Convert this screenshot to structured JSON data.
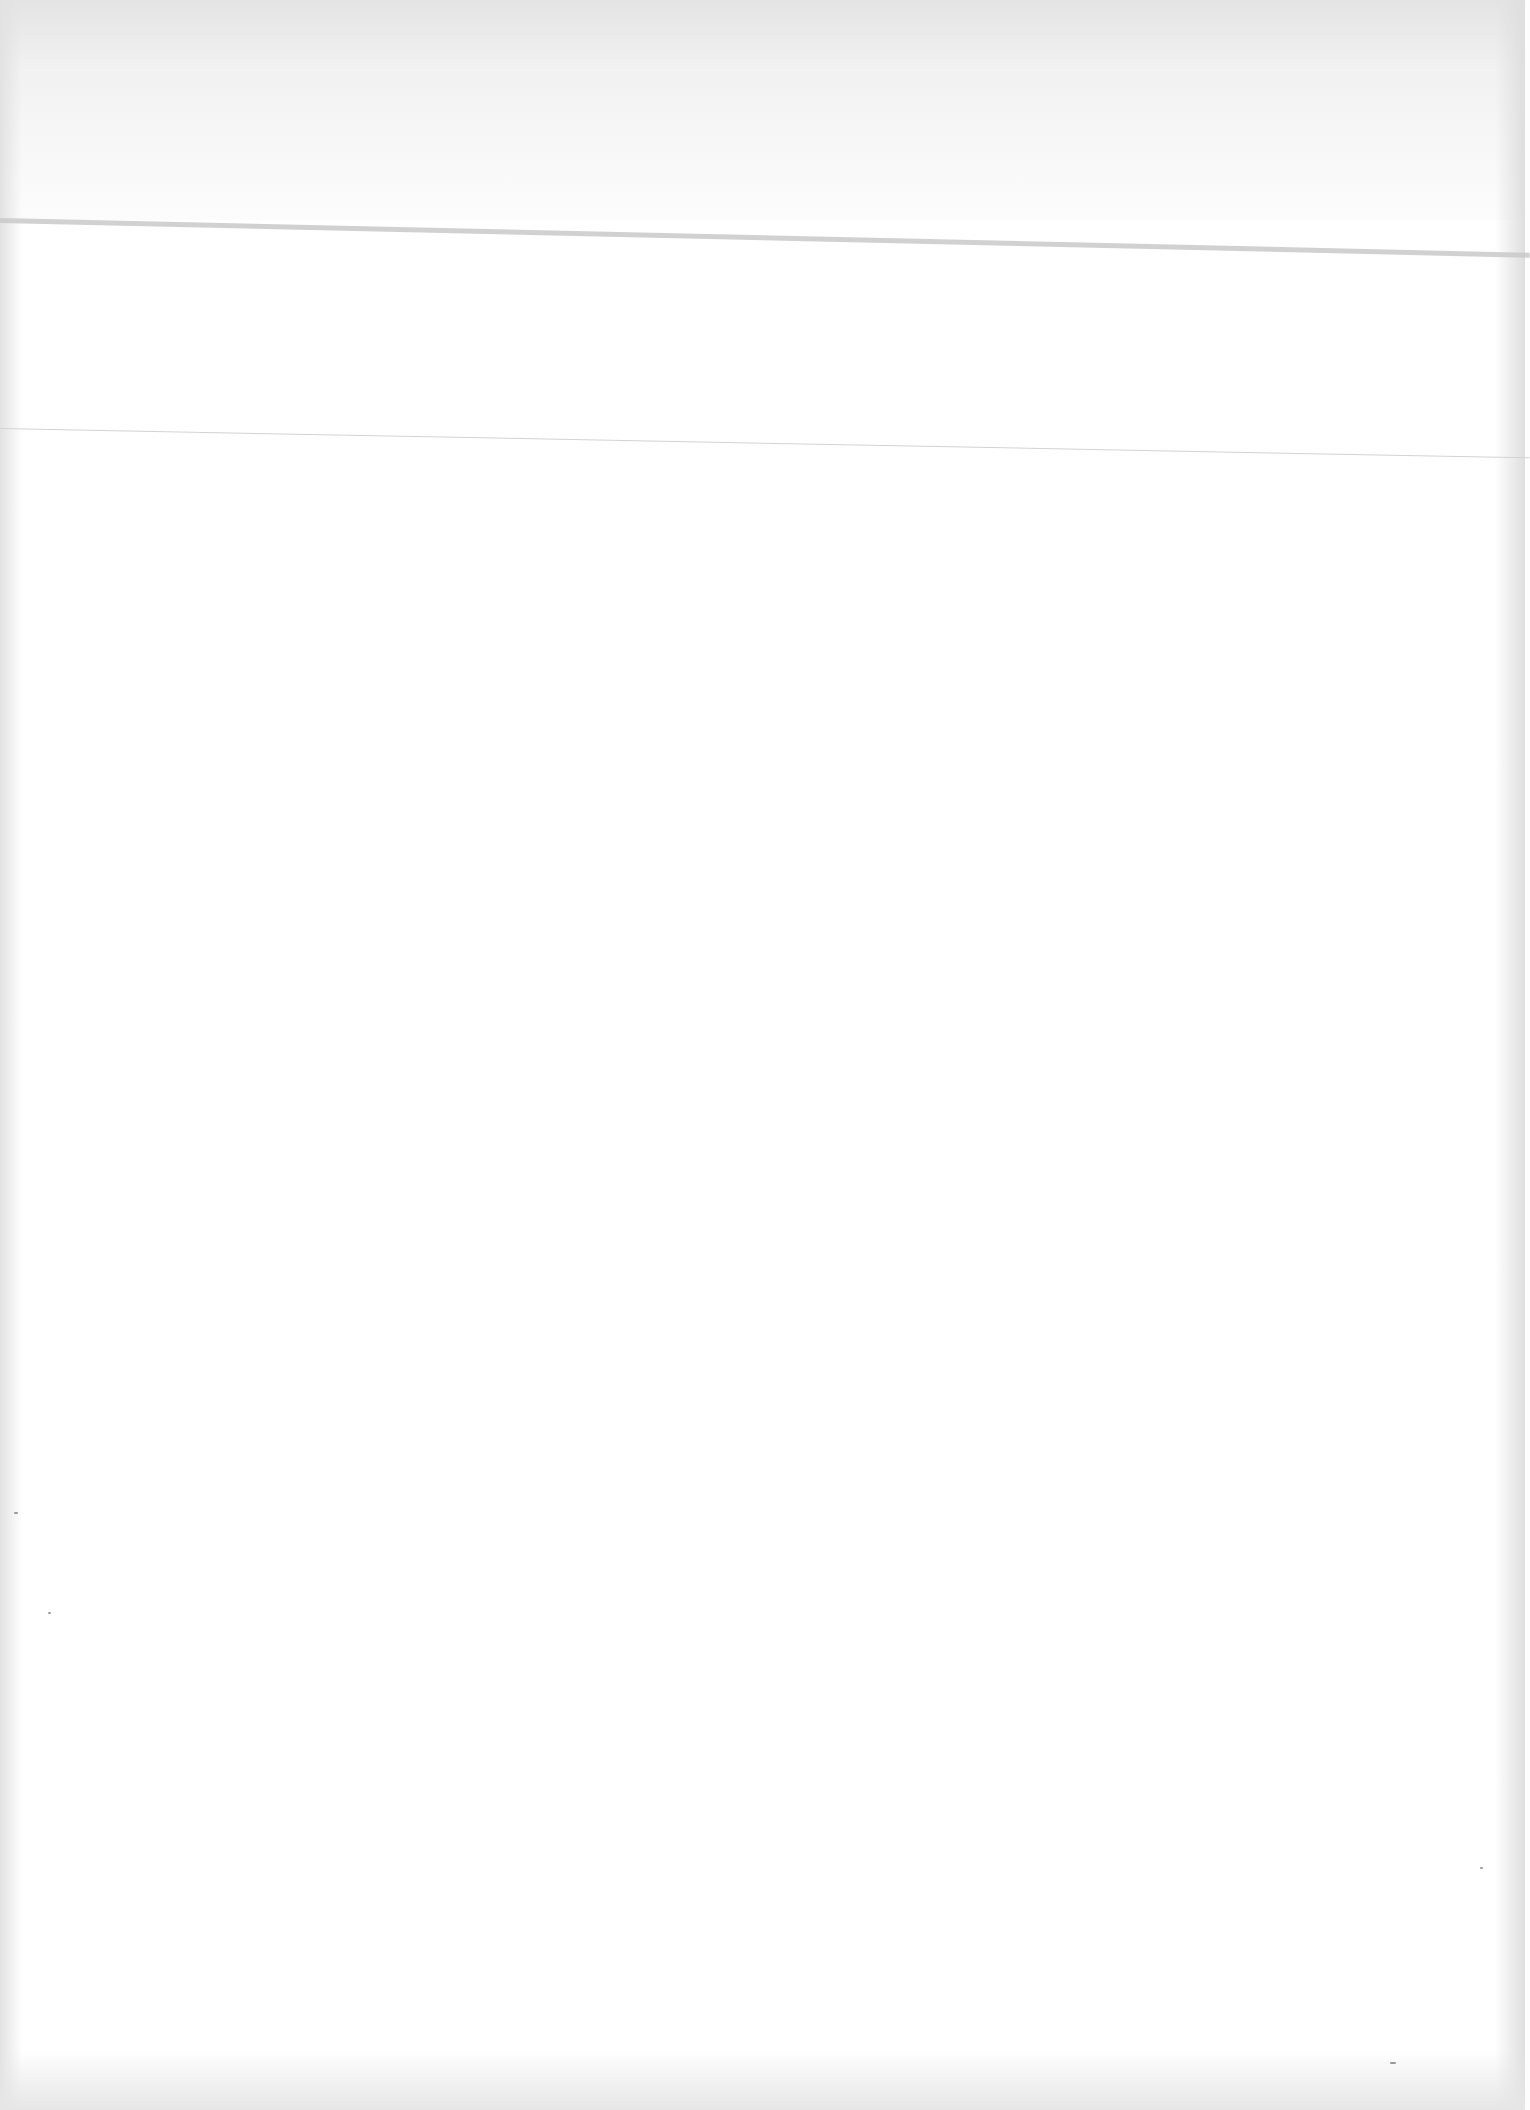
{
  "document": {
    "type": "blank-scanned-page",
    "text_content": "",
    "rules": [
      {
        "name": "top-rule",
        "weight": "thick"
      },
      {
        "name": "mid-rule",
        "weight": "thin"
      }
    ],
    "colors": {
      "paper": "#ffffff",
      "edge_shadow": "#e2e2e2",
      "rule": "#c9c9c9"
    }
  }
}
